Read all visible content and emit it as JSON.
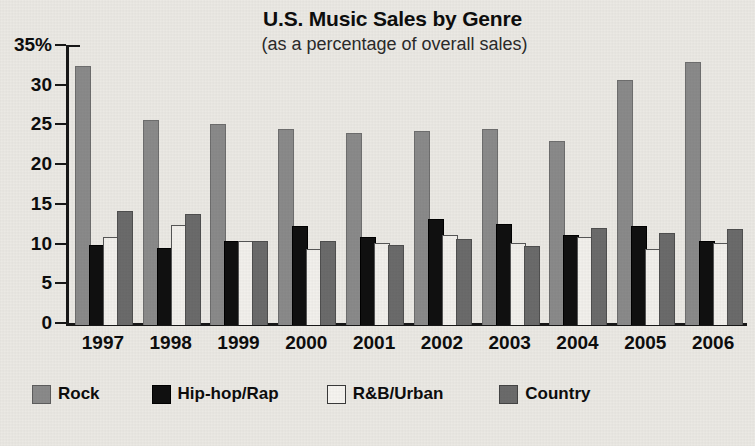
{
  "chart_data": {
    "type": "bar",
    "title": "U.S. Music Sales by Genre",
    "subtitle": "(as a percentage of overall sales)",
    "xlabel": "",
    "ylabel": "",
    "ylim": [
      0,
      35
    ],
    "grid": false,
    "legend_position": "bottom",
    "y_ticks": [
      "0",
      "5",
      "10",
      "15",
      "20",
      "25",
      "30",
      "35%"
    ],
    "y_tick_values": [
      0,
      5,
      10,
      15,
      20,
      25,
      30,
      35
    ],
    "categories": [
      "1997",
      "1998",
      "1999",
      "2000",
      "2001",
      "2002",
      "2003",
      "2004",
      "2005",
      "2006"
    ],
    "series": [
      {
        "name": "Rock",
        "color": "#8a8a8a",
        "values": [
          32.5,
          25.7,
          25.2,
          24.6,
          24.1,
          24.3,
          24.6,
          23.0,
          30.7,
          33.0
        ]
      },
      {
        "name": "Hip-hop/Rap",
        "color": "#101010",
        "values": [
          9.9,
          9.6,
          10.5,
          12.4,
          10.9,
          13.2,
          12.6,
          11.2,
          12.4,
          10.4
        ]
      },
      {
        "name": "R&B/Urban",
        "color": "#f2f0ec",
        "values": [
          11.0,
          12.5,
          10.5,
          9.4,
          10.2,
          11.2,
          10.2,
          11.0,
          9.4,
          10.2
        ]
      },
      {
        "name": "Country",
        "color": "#6b6b6b",
        "values": [
          14.2,
          13.8,
          10.5,
          10.4,
          9.9,
          10.7,
          9.8,
          12.1,
          11.5,
          11.9
        ]
      }
    ]
  },
  "legend": {
    "items": [
      {
        "label": "Rock",
        "swatch": "rock"
      },
      {
        "label": "Hip-hop/Rap",
        "swatch": "hiphop"
      },
      {
        "label": "R&B/Urban",
        "swatch": "rnb"
      },
      {
        "label": "Country",
        "swatch": "country"
      }
    ]
  }
}
